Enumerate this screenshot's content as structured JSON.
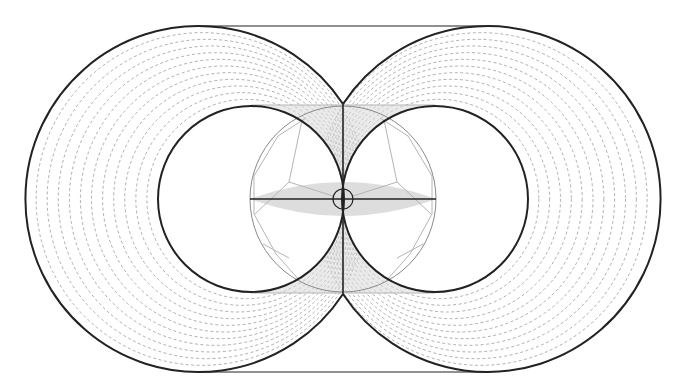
{
  "diagram": {
    "width": 680,
    "height": 391,
    "background": "#ffffff",
    "colors": {
      "stroke_dark": "#222222",
      "stroke_mid": "#8a8a8a",
      "stroke_light": "#b5b5b5",
      "dash": "#9a9a9a",
      "shade": "#d9d9d9"
    },
    "top_line": {
      "x1": 198,
      "y1": 26,
      "x2": 485,
      "y2": 26
    },
    "bottom_line": {
      "x1": 198,
      "y1": 372,
      "x2": 485,
      "y2": 372
    },
    "outer_circles": [
      {
        "name": "left",
        "cx": 198,
        "cy": 199,
        "r": 173
      },
      {
        "name": "right",
        "cx": 485,
        "cy": 199,
        "r": 173
      }
    ],
    "inner_circles": [
      {
        "name": "left",
        "cx": 251,
        "cy": 199,
        "r": 93
      },
      {
        "name": "right",
        "cx": 435,
        "cy": 199,
        "r": 93
      }
    ],
    "dashed_ring_count": 11,
    "central_circle": {
      "cx": 343,
      "cy": 199,
      "r": 93
    },
    "center_small_circle": {
      "cx": 343,
      "cy": 199,
      "r": 10
    },
    "vertical_axis": {
      "x": 343,
      "y1": 104,
      "y2": 294
    },
    "horizontal_axis": {
      "y": 199,
      "x1": 250,
      "x2": 436
    },
    "shaded_band": {
      "x1": 251,
      "x2": 435,
      "y1": 105,
      "y2": 293
    },
    "lens": {
      "x1": 250,
      "x2": 436,
      "cy": 199,
      "half_height": 17
    },
    "polygon_left": [
      [
        306,
        118
      ],
      [
        278,
        136
      ],
      [
        254,
        176
      ],
      [
        254,
        214
      ],
      [
        276,
        254
      ],
      [
        300,
        281
      ]
    ],
    "polygon_right": [
      [
        380,
        118
      ],
      [
        408,
        136
      ],
      [
        432,
        176
      ],
      [
        432,
        214
      ],
      [
        410,
        254
      ],
      [
        386,
        281
      ]
    ],
    "spokes_left": [
      [
        [
          289,
          182
        ],
        [
          302,
          120
        ]
      ],
      [
        [
          289,
          182
        ],
        [
          255,
          214
        ]
      ],
      [
        [
          289,
          182
        ],
        [
          333,
          196
        ]
      ]
    ],
    "spokes_right": [
      [
        [
          397,
          182
        ],
        [
          384,
          120
        ]
      ],
      [
        [
          397,
          182
        ],
        [
          431,
          214
        ]
      ],
      [
        [
          397,
          182
        ],
        [
          353,
          196
        ]
      ],
      [
        [
          397,
          258
        ],
        [
          423,
          244
        ]
      ],
      [
        [
          289,
          258
        ],
        [
          263,
          244
        ]
      ]
    ]
  }
}
